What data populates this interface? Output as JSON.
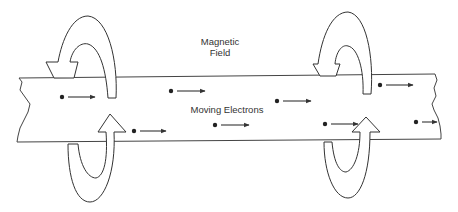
{
  "labels": {
    "field_line1": "Magnetic",
    "field_line2": "Field",
    "electrons": "Moving Electrons"
  },
  "colors": {
    "stroke": "#333333",
    "background": "#ffffff"
  },
  "electrons": [
    {
      "x": 62,
      "y": 97,
      "x2": 95
    },
    {
      "x": 134,
      "y": 131,
      "x2": 166
    },
    {
      "x": 171,
      "y": 91,
      "x2": 205
    },
    {
      "x": 215,
      "y": 125,
      "x2": 249
    },
    {
      "x": 277,
      "y": 101,
      "x2": 311
    },
    {
      "x": 325,
      "y": 124,
      "x2": 358
    },
    {
      "x": 380,
      "y": 85,
      "x2": 413
    },
    {
      "x": 416,
      "y": 122,
      "x2": 437
    }
  ]
}
